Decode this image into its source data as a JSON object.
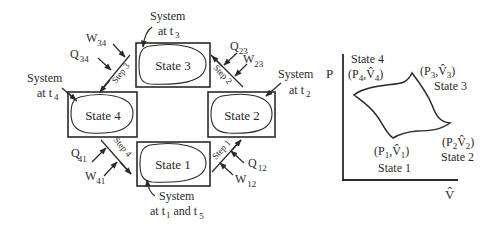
{
  "cycle_diagram": {
    "states": [
      {
        "id": "state-1",
        "label": "State 1"
      },
      {
        "id": "state-2",
        "label": "State 2"
      },
      {
        "id": "state-3",
        "label": "State 3"
      },
      {
        "id": "state-4",
        "label": "State 4"
      }
    ],
    "steps": [
      {
        "label": "Step 1",
        "heat": "Q",
        "heat_sub": "12",
        "work": "W",
        "work_sub": "12"
      },
      {
        "label": "Step 2",
        "heat": "Q",
        "heat_sub": "23",
        "work": "W",
        "work_sub": "23"
      },
      {
        "label": "Step 3",
        "heat": "Q",
        "heat_sub": "34",
        "work": "W",
        "work_sub": "34"
      },
      {
        "label": "Step 4",
        "heat": "Q",
        "heat_sub": "41",
        "work": "W",
        "work_sub": "41"
      }
    ],
    "system_labels": {
      "t1": {
        "line1": "System",
        "line2_a": "at t",
        "sub_a": "1",
        "line2_b": " and t",
        "sub_b": "5"
      },
      "t2": {
        "line1": "System",
        "line2": "at t",
        "sub": "2"
      },
      "t3": {
        "line1": "System",
        "line2": "at t",
        "sub": "3"
      },
      "t4": {
        "line1": "System",
        "line2": "at t",
        "sub": "4"
      }
    }
  },
  "pv_diagram": {
    "y_axis_label": "P",
    "x_axis_label": "V̂",
    "points": [
      {
        "state": "State 1",
        "p": "P",
        "p_sub": "1",
        "v": "V̂",
        "v_sub": "1"
      },
      {
        "state": "State 2",
        "p": "P",
        "p_sub": "2",
        "v": "V̂",
        "v_sub": "2"
      },
      {
        "state": "State 3",
        "p": "P",
        "p_sub": "3",
        "v": "V̂",
        "v_sub": "3"
      },
      {
        "state": "State 4",
        "p": "P",
        "p_sub": "4",
        "v": "V̂",
        "v_sub": "4"
      }
    ]
  }
}
